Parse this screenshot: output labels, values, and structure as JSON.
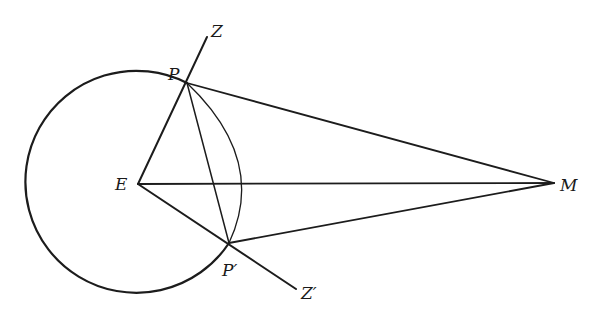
{
  "labels": {
    "Z": "Z",
    "P": "P",
    "E": "E",
    "M": "M",
    "P_prime": "P′",
    "Z_prime": "Z′"
  },
  "colors": {
    "ink": "#1c1c1c",
    "background": "#ffffff"
  },
  "geometry": {
    "E": [
      138,
      184
    ],
    "P": [
      187,
      83
    ],
    "P_prime": [
      229,
      243
    ],
    "M": [
      554,
      183
    ],
    "Z_end": [
      207,
      37
    ],
    "Z_prime_end": [
      296,
      289
    ],
    "big_circle_radius": 111,
    "small_arc_rightmost": [
      247,
      184
    ]
  }
}
